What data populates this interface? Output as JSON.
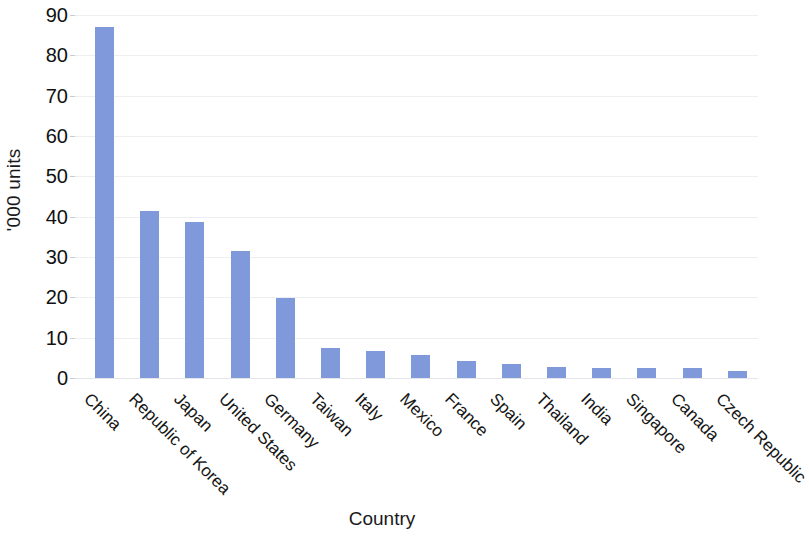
{
  "chart_data": {
    "type": "bar",
    "title": "",
    "xlabel": "Country",
    "ylabel": "'000 units",
    "ylim": [
      0,
      90
    ],
    "yticks": [
      0,
      10,
      20,
      30,
      40,
      50,
      60,
      70,
      80,
      90
    ],
    "ytick_labels": [
      "0",
      "10",
      "20",
      "30",
      "40",
      "50",
      "60",
      "70",
      "80",
      "90"
    ],
    "grid": true,
    "legend": null,
    "bar_color": "#8099db",
    "categories": [
      "China",
      "Republic of Korea",
      "Japan",
      "United States",
      "Germany",
      "Taiwan",
      "Italy",
      "Mexico",
      "France",
      "Spain",
      "Thailand",
      "India",
      "Singapore",
      "Canada",
      "Czech Republic"
    ],
    "values": [
      87,
      41.5,
      38.7,
      31.5,
      19.8,
      7.4,
      6.7,
      5.7,
      4.2,
      3.5,
      2.7,
      2.6,
      2.5,
      2.4,
      1.7
    ]
  }
}
